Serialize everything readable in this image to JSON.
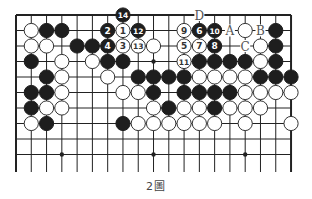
{
  "diagram": {
    "title": "2圖",
    "grid": {
      "x0": 16,
      "y0": 15,
      "dx": 15.28,
      "dy": 15.5,
      "cols": 19,
      "rows_drawn": 10,
      "bottom_extend_y": 172,
      "top_edge": true,
      "left_edge": true,
      "right_edge": true,
      "bottom_edge": false
    },
    "colors": {
      "line": "#222222",
      "black_stone": "#1e1e1e",
      "white_stone": "#ffffff",
      "label": "#555555"
    },
    "star_points": [
      [
        3,
        3
      ],
      [
        9,
        3
      ],
      [
        15,
        3
      ],
      [
        3,
        9
      ],
      [
        9,
        9
      ],
      [
        15,
        9
      ]
    ],
    "stones": [
      {
        "c": 7,
        "r": 0,
        "color": "black",
        "num": "14"
      },
      {
        "c": 1,
        "r": 1,
        "color": "white"
      },
      {
        "c": 2,
        "r": 1,
        "color": "black"
      },
      {
        "c": 3,
        "r": 1,
        "color": "black"
      },
      {
        "c": 6,
        "r": 1,
        "color": "black",
        "num": "2"
      },
      {
        "c": 7,
        "r": 1,
        "color": "white",
        "num": "1"
      },
      {
        "c": 8,
        "r": 1,
        "color": "black",
        "num": "12"
      },
      {
        "c": 11,
        "r": 1,
        "color": "white",
        "num": "9"
      },
      {
        "c": 12,
        "r": 1,
        "color": "black",
        "num": "6"
      },
      {
        "c": 13,
        "r": 1,
        "color": "black",
        "num": "10"
      },
      {
        "c": 15,
        "r": 1,
        "color": "white"
      },
      {
        "c": 17,
        "r": 1,
        "color": "black"
      },
      {
        "c": 1,
        "r": 2,
        "color": "white"
      },
      {
        "c": 2,
        "r": 2,
        "color": "white"
      },
      {
        "c": 4,
        "r": 2,
        "color": "black"
      },
      {
        "c": 5,
        "r": 2,
        "color": "black"
      },
      {
        "c": 6,
        "r": 2,
        "color": "black",
        "num": "4"
      },
      {
        "c": 7,
        "r": 2,
        "color": "white",
        "num": "3"
      },
      {
        "c": 8,
        "r": 2,
        "color": "white",
        "num": "13"
      },
      {
        "c": 9,
        "r": 2,
        "color": "white"
      },
      {
        "c": 11,
        "r": 2,
        "color": "white",
        "num": "5"
      },
      {
        "c": 12,
        "r": 2,
        "color": "white",
        "num": "7"
      },
      {
        "c": 13,
        "r": 2,
        "color": "black",
        "num": "8"
      },
      {
        "c": 16,
        "r": 2,
        "color": "white"
      },
      {
        "c": 17,
        "r": 2,
        "color": "black"
      },
      {
        "c": 1,
        "r": 3,
        "color": "black"
      },
      {
        "c": 3,
        "r": 3,
        "color": "white"
      },
      {
        "c": 5,
        "r": 3,
        "color": "white"
      },
      {
        "c": 6,
        "r": 3,
        "color": "black"
      },
      {
        "c": 7,
        "r": 3,
        "color": "black"
      },
      {
        "c": 11,
        "r": 3,
        "color": "white",
        "num": "11"
      },
      {
        "c": 12,
        "r": 3,
        "color": "black"
      },
      {
        "c": 13,
        "r": 3,
        "color": "black"
      },
      {
        "c": 14,
        "r": 3,
        "color": "black"
      },
      {
        "c": 15,
        "r": 3,
        "color": "black"
      },
      {
        "c": 16,
        "r": 3,
        "color": "white"
      },
      {
        "c": 17,
        "r": 3,
        "color": "black"
      },
      {
        "c": 2,
        "r": 4,
        "color": "black"
      },
      {
        "c": 3,
        "r": 4,
        "color": "white"
      },
      {
        "c": 6,
        "r": 4,
        "color": "white"
      },
      {
        "c": 8,
        "r": 4,
        "color": "black"
      },
      {
        "c": 9,
        "r": 4,
        "color": "black"
      },
      {
        "c": 10,
        "r": 4,
        "color": "black"
      },
      {
        "c": 11,
        "r": 4,
        "color": "black"
      },
      {
        "c": 12,
        "r": 4,
        "color": "white"
      },
      {
        "c": 13,
        "r": 4,
        "color": "white"
      },
      {
        "c": 14,
        "r": 4,
        "color": "white"
      },
      {
        "c": 15,
        "r": 4,
        "color": "white"
      },
      {
        "c": 16,
        "r": 4,
        "color": "black"
      },
      {
        "c": 17,
        "r": 4,
        "color": "black"
      },
      {
        "c": 18,
        "r": 4,
        "color": "black"
      },
      {
        "c": 1,
        "r": 5,
        "color": "black"
      },
      {
        "c": 2,
        "r": 5,
        "color": "black"
      },
      {
        "c": 3,
        "r": 5,
        "color": "white"
      },
      {
        "c": 7,
        "r": 5,
        "color": "white"
      },
      {
        "c": 8,
        "r": 5,
        "color": "white"
      },
      {
        "c": 9,
        "r": 5,
        "color": "black"
      },
      {
        "c": 11,
        "r": 5,
        "color": "black"
      },
      {
        "c": 12,
        "r": 5,
        "color": "black"
      },
      {
        "c": 13,
        "r": 5,
        "color": "black"
      },
      {
        "c": 14,
        "r": 5,
        "color": "black"
      },
      {
        "c": 15,
        "r": 5,
        "color": "white"
      },
      {
        "c": 16,
        "r": 5,
        "color": "white"
      },
      {
        "c": 17,
        "r": 5,
        "color": "white"
      },
      {
        "c": 18,
        "r": 5,
        "color": "white"
      },
      {
        "c": 1,
        "r": 6,
        "color": "black"
      },
      {
        "c": 2,
        "r": 6,
        "color": "white"
      },
      {
        "c": 3,
        "r": 6,
        "color": "white"
      },
      {
        "c": 9,
        "r": 6,
        "color": "white"
      },
      {
        "c": 10,
        "r": 6,
        "color": "black"
      },
      {
        "c": 11,
        "r": 6,
        "color": "white"
      },
      {
        "c": 12,
        "r": 6,
        "color": "white"
      },
      {
        "c": 13,
        "r": 6,
        "color": "black"
      },
      {
        "c": 14,
        "r": 6,
        "color": "white"
      },
      {
        "c": 15,
        "r": 6,
        "color": "white"
      },
      {
        "c": 16,
        "r": 6,
        "color": "white"
      },
      {
        "c": 1,
        "r": 7,
        "color": "white"
      },
      {
        "c": 2,
        "r": 7,
        "color": "black"
      },
      {
        "c": 7,
        "r": 7,
        "color": "black"
      },
      {
        "c": 8,
        "r": 7,
        "color": "white"
      },
      {
        "c": 9,
        "r": 7,
        "color": "white"
      },
      {
        "c": 10,
        "r": 7,
        "color": "white"
      },
      {
        "c": 11,
        "r": 7,
        "color": "white"
      },
      {
        "c": 12,
        "r": 7,
        "color": "white"
      },
      {
        "c": 13,
        "r": 7,
        "color": "white"
      },
      {
        "c": 15,
        "r": 7,
        "color": "white"
      },
      {
        "c": 18,
        "r": 7,
        "color": "white"
      }
    ],
    "letters": [
      {
        "c": 12,
        "r": 0,
        "text": "D"
      },
      {
        "c": 14,
        "r": 1,
        "text": "A"
      },
      {
        "c": 16,
        "r": 1,
        "text": "B"
      },
      {
        "c": 15,
        "r": 2,
        "text": "C"
      }
    ]
  }
}
